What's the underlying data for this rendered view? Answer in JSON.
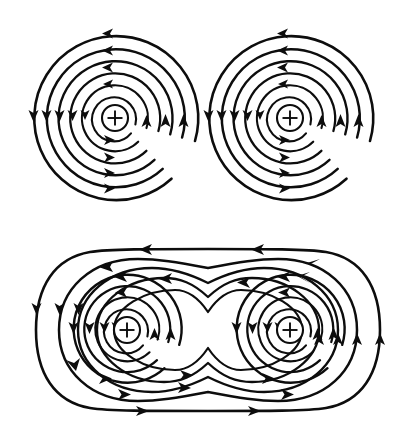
{
  "figure": {
    "background_color": "#ffffff",
    "line_color": "#0d0d0d",
    "width": 398,
    "height": 441,
    "panel_count": 2
  },
  "panels": [
    {
      "id": "panel-separate",
      "name": "separate-conductors-panel",
      "caption": "",
      "description": "Two isolated conductors, each surrounded by concentric circular field lines",
      "bounds": {
        "x": 0,
        "y": 0,
        "width": 398,
        "height": 210
      },
      "conductors": [
        {
          "id": "wire-top-left",
          "name": "conductor-top-left",
          "symbol": "+",
          "symbol_meaning": "current-out-of-page",
          "center": {
            "x": 115,
            "y": 118
          },
          "core_radius": 13,
          "field_direction": "counterclockwise",
          "ring_radii": [
            22,
            33,
            45,
            57,
            69,
            82
          ],
          "arrow_count": 13
        },
        {
          "id": "wire-top-right",
          "name": "conductor-top-right",
          "symbol": "+",
          "symbol_meaning": "current-out-of-page",
          "center": {
            "x": 290,
            "y": 118
          },
          "core_radius": 13,
          "field_direction": "counterclockwise",
          "ring_radii": [
            22,
            33,
            45,
            57,
            69,
            82
          ],
          "arrow_count": 13
        }
      ]
    },
    {
      "id": "panel-combined",
      "name": "combined-field-panel",
      "caption": "",
      "description": "Two conductors close together; inner loops remain circular, outer loops merge into a single enclosing figure with a saddle point midway between the wires",
      "bounds": {
        "x": 0,
        "y": 225,
        "width": 398,
        "height": 216
      },
      "conductors": [
        {
          "id": "wire-bottom-left",
          "name": "conductor-bottom-left",
          "symbol": "+",
          "symbol_meaning": "current-out-of-page",
          "center": {
            "x": 127,
            "y": 330
          },
          "core_radius": 13,
          "field_direction": "counterclockwise",
          "ring_radii": [
            22,
            32,
            43,
            54
          ],
          "arrow_count": 10
        },
        {
          "id": "wire-bottom-right",
          "name": "conductor-bottom-right",
          "symbol": "+",
          "symbol_meaning": "current-out-of-page",
          "center": {
            "x": 290,
            "y": 330
          },
          "core_radius": 13,
          "field_direction": "counterclockwise",
          "ring_radii": [
            22,
            32,
            43,
            54
          ],
          "arrow_count": 10
        }
      ],
      "merged_loops": {
        "name": "merged-outer-loops",
        "count": 5,
        "direction": "counterclockwise",
        "top_edge_arrows": 2,
        "top_edge_arrow_direction": "left",
        "bottom_edge_arrows": 2,
        "bottom_edge_arrow_direction": "right",
        "saddle_point": {
          "x": 208,
          "y": 330
        }
      }
    }
  ],
  "legend": {
    "plus_symbol": "+",
    "plus_meaning": "current out of page",
    "arrow_meaning": "field direction"
  }
}
